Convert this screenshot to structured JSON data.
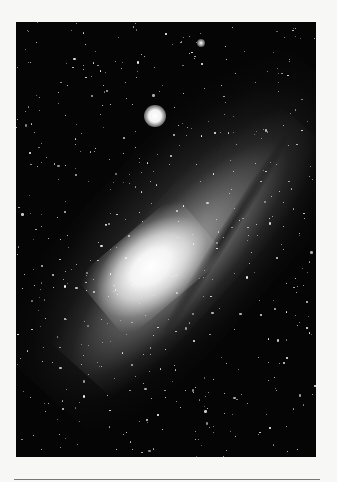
{
  "image": {
    "subject": "spiral galaxy with bright core, dust lanes, and a bright satellite galaxy on a dark star field",
    "palette": {
      "background": "#f7f7f5",
      "sky": "#050505",
      "core": "#ffffff",
      "rule": "#777777"
    }
  }
}
